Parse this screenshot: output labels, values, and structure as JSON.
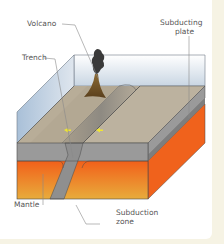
{
  "diagram": {
    "labels": {
      "volcano": "Volcano",
      "trench": "Trench",
      "subducting_plate_line1": "Subducting",
      "subducting_plate_line2": "plate",
      "mantle": "Mantle",
      "subduction_zone_line1": "Subduction",
      "subduction_zone_line2": "zone"
    },
    "colors": {
      "background": "#f6f3e4",
      "card": "#ffffff",
      "water": "#b9cde0",
      "crust_top": "#b9ad98",
      "crust_side": "#8f8f8f",
      "mantle_top": "#f26a1b",
      "mantle_bottom": "#e9a83a",
      "volcano": "#7a5a2a",
      "smoke": "#3a3a3a",
      "arrow": "#f0e630",
      "leader_line": "#8a8a8a"
    }
  }
}
